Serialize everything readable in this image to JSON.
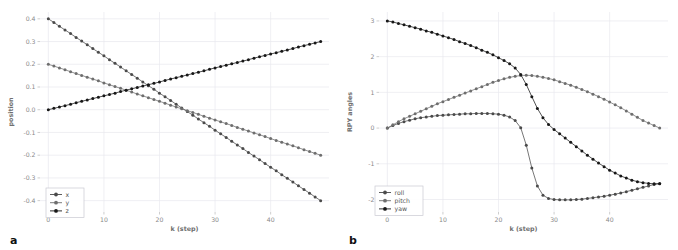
{
  "figure": {
    "panels": [
      {
        "letter": "a",
        "chart_index": 0
      },
      {
        "letter": "b",
        "chart_index": 1
      }
    ]
  },
  "chart_data": [
    {
      "type": "line",
      "title": "",
      "xlabel": "k (step)",
      "ylabel": "position",
      "xlim": [
        -1.5,
        50.5
      ],
      "ylim": [
        -0.45,
        0.43
      ],
      "xticks": [
        0,
        10,
        20,
        30,
        40
      ],
      "xticklabels": [
        "0",
        "10",
        "20",
        "30",
        "40"
      ],
      "yticks": [
        0.4,
        0.3,
        0.2,
        0.1,
        0.0,
        -0.1,
        -0.2,
        -0.3,
        -0.4
      ],
      "yticklabels": [
        "0.4",
        "0.3",
        "0.2",
        "0.1",
        "0.0",
        "-0.1",
        "-0.2",
        "-0.3",
        "-0.4"
      ],
      "grid": true,
      "legend_position": "lower left",
      "marker": "circle",
      "x": [
        0,
        1,
        2,
        3,
        4,
        5,
        6,
        7,
        8,
        9,
        10,
        11,
        12,
        13,
        14,
        15,
        16,
        17,
        18,
        19,
        20,
        21,
        22,
        23,
        24,
        25,
        26,
        27,
        28,
        29,
        30,
        31,
        32,
        33,
        34,
        35,
        36,
        37,
        38,
        39,
        40,
        41,
        42,
        43,
        44,
        45,
        46,
        47,
        48,
        49
      ],
      "series": [
        {
          "name": "x",
          "color": "#4a4a4a",
          "values": [
            0.4,
            0.384,
            0.367,
            0.351,
            0.335,
            0.318,
            0.302,
            0.286,
            0.269,
            0.253,
            0.237,
            0.22,
            0.204,
            0.188,
            0.171,
            0.155,
            0.139,
            0.122,
            0.106,
            0.09,
            0.073,
            0.057,
            0.041,
            0.024,
            0.008,
            -0.008,
            -0.024,
            -0.041,
            -0.057,
            -0.073,
            -0.09,
            -0.106,
            -0.122,
            -0.139,
            -0.155,
            -0.171,
            -0.188,
            -0.204,
            -0.22,
            -0.237,
            -0.253,
            -0.269,
            -0.286,
            -0.302,
            -0.318,
            -0.335,
            -0.351,
            -0.367,
            -0.384,
            -0.4
          ]
        },
        {
          "name": "y",
          "color": "#6e6e6e",
          "values": [
            0.2,
            0.192,
            0.184,
            0.176,
            0.167,
            0.159,
            0.151,
            0.143,
            0.135,
            0.127,
            0.118,
            0.11,
            0.102,
            0.094,
            0.086,
            0.078,
            0.069,
            0.061,
            0.053,
            0.045,
            0.037,
            0.029,
            0.02,
            0.012,
            0.004,
            -0.004,
            -0.012,
            -0.02,
            -0.029,
            -0.037,
            -0.045,
            -0.053,
            -0.061,
            -0.069,
            -0.078,
            -0.086,
            -0.094,
            -0.102,
            -0.11,
            -0.118,
            -0.127,
            -0.135,
            -0.143,
            -0.151,
            -0.159,
            -0.167,
            -0.176,
            -0.184,
            -0.192,
            -0.2
          ]
        },
        {
          "name": "z",
          "color": "#171717",
          "values": [
            0.0,
            0.006,
            0.012,
            0.018,
            0.024,
            0.031,
            0.037,
            0.043,
            0.049,
            0.055,
            0.061,
            0.067,
            0.073,
            0.08,
            0.086,
            0.092,
            0.098,
            0.104,
            0.11,
            0.116,
            0.122,
            0.129,
            0.135,
            0.141,
            0.147,
            0.153,
            0.159,
            0.165,
            0.171,
            0.178,
            0.184,
            0.19,
            0.196,
            0.202,
            0.208,
            0.214,
            0.22,
            0.227,
            0.233,
            0.239,
            0.245,
            0.251,
            0.257,
            0.263,
            0.269,
            0.276,
            0.282,
            0.288,
            0.294,
            0.3
          ]
        }
      ]
    },
    {
      "type": "line",
      "title": "",
      "xlabel": "k (step)",
      "ylabel": "RPY angles",
      "xlim": [
        -1.5,
        50.5
      ],
      "ylim": [
        -2.35,
        3.25
      ],
      "xticks": [
        0,
        10,
        20,
        30,
        40
      ],
      "xticklabels": [
        "0",
        "10",
        "20",
        "30",
        "40"
      ],
      "yticks": [
        3,
        2,
        1,
        0,
        -1,
        -2
      ],
      "yticklabels": [
        "3",
        "2",
        "1",
        "0",
        "-1",
        "-2"
      ],
      "grid": true,
      "legend_position": "lower left",
      "marker": "circle",
      "x": [
        0,
        1,
        2,
        3,
        4,
        5,
        6,
        7,
        8,
        9,
        10,
        11,
        12,
        13,
        14,
        15,
        16,
        17,
        18,
        19,
        20,
        21,
        22,
        23,
        24,
        25,
        26,
        27,
        28,
        29,
        30,
        31,
        32,
        33,
        34,
        35,
        36,
        37,
        38,
        39,
        40,
        41,
        42,
        43,
        44,
        45,
        46,
        47,
        48,
        49
      ],
      "series": [
        {
          "name": "roll",
          "color": "#4a4a4a",
          "values": [
            0.0,
            0.07,
            0.13,
            0.18,
            0.22,
            0.26,
            0.29,
            0.31,
            0.33,
            0.35,
            0.36,
            0.37,
            0.38,
            0.39,
            0.4,
            0.4,
            0.41,
            0.41,
            0.41,
            0.4,
            0.39,
            0.36,
            0.31,
            0.21,
            0.01,
            -0.48,
            -1.12,
            -1.62,
            -1.88,
            -1.97,
            -2.0,
            -2.01,
            -2.01,
            -2.01,
            -2.0,
            -1.99,
            -1.97,
            -1.95,
            -1.93,
            -1.91,
            -1.88,
            -1.85,
            -1.82,
            -1.78,
            -1.74,
            -1.7,
            -1.66,
            -1.62,
            -1.58,
            -1.55
          ]
        },
        {
          "name": "pitch",
          "color": "#6e6e6e",
          "values": [
            0.0,
            0.09,
            0.18,
            0.26,
            0.33,
            0.4,
            0.47,
            0.54,
            0.61,
            0.68,
            0.74,
            0.8,
            0.86,
            0.92,
            0.98,
            1.04,
            1.1,
            1.16,
            1.22,
            1.28,
            1.33,
            1.38,
            1.42,
            1.45,
            1.47,
            1.48,
            1.47,
            1.45,
            1.42,
            1.39,
            1.35,
            1.3,
            1.25,
            1.2,
            1.14,
            1.08,
            1.02,
            0.95,
            0.88,
            0.81,
            0.73,
            0.65,
            0.57,
            0.48,
            0.39,
            0.3,
            0.21,
            0.14,
            0.07,
            0.0
          ]
        },
        {
          "name": "yaw",
          "color": "#171717",
          "values": [
            3.0,
            2.97,
            2.93,
            2.89,
            2.85,
            2.81,
            2.77,
            2.72,
            2.68,
            2.63,
            2.58,
            2.53,
            2.48,
            2.42,
            2.37,
            2.31,
            2.25,
            2.18,
            2.12,
            2.05,
            1.97,
            1.89,
            1.8,
            1.68,
            1.5,
            1.22,
            0.88,
            0.55,
            0.29,
            0.1,
            -0.04,
            -0.16,
            -0.28,
            -0.4,
            -0.52,
            -0.64,
            -0.76,
            -0.87,
            -0.98,
            -1.08,
            -1.18,
            -1.26,
            -1.34,
            -1.4,
            -1.46,
            -1.5,
            -1.53,
            -1.55,
            -1.56,
            -1.56
          ]
        }
      ]
    }
  ]
}
